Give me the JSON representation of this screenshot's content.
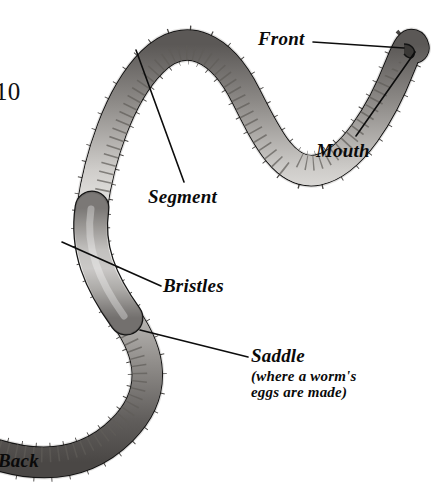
{
  "page": {
    "page_number": "10",
    "background_color": "#ffffff",
    "width": 433,
    "height": 499
  },
  "subject": {
    "name": "earthworm",
    "body_color_light": "#e8e6e4",
    "body_color_mid": "#9a9894",
    "body_color_dark": "#4a4846",
    "outline_color": "#141414"
  },
  "labels": {
    "front": "Front",
    "mouth": "Mouth",
    "segment": "Segment",
    "bristles": "Bristles",
    "saddle": "Saddle",
    "saddle_note": "(where a worm's\neggs are made)",
    "back": "Back"
  },
  "leader_lines": {
    "color": "#0d0d0d",
    "width": 1.6,
    "front": {
      "x1": 313,
      "y1": 42,
      "x2": 404,
      "y2": 48
    },
    "mouth": {
      "x1": 356,
      "y1": 136,
      "x2": 415,
      "y2": 52
    },
    "segment": {
      "x1": 184,
      "y1": 182,
      "x2": 136,
      "y2": 50
    },
    "bristles": {
      "x1": 161,
      "y1": 286,
      "x2": 62,
      "y2": 242
    },
    "saddle": {
      "x1": 248,
      "y1": 357,
      "x2": 140,
      "y2": 330
    }
  },
  "anatomy_parts": [
    {
      "id": "front",
      "label": "Front",
      "description": "anterior end of the worm"
    },
    {
      "id": "mouth",
      "label": "Mouth",
      "description": "opening at the tip of the front end"
    },
    {
      "id": "segment",
      "label": "Segment",
      "description": "one of the many ring-like body divisions"
    },
    {
      "id": "bristles",
      "label": "Bristles",
      "description": "tiny hairs along the body used for gripping"
    },
    {
      "id": "saddle",
      "label": "Saddle",
      "description": "where a worm's eggs are made"
    },
    {
      "id": "back",
      "label": "Back",
      "description": "posterior end of the worm"
    }
  ]
}
